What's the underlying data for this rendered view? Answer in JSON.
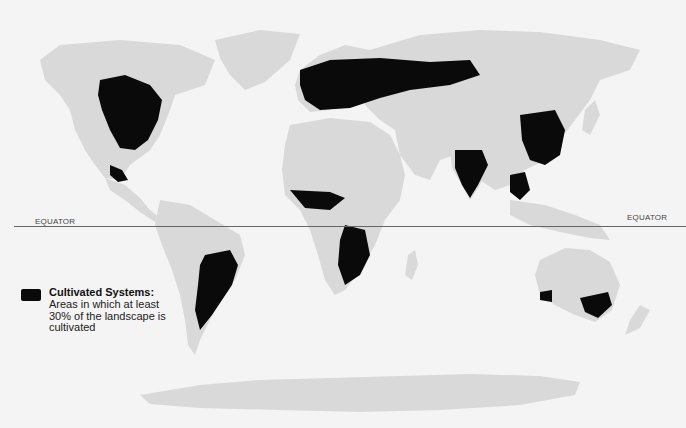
{
  "map": {
    "type": "world-thematic-map",
    "equator_label_left": "EQUATOR",
    "equator_label_right": "EQUATOR",
    "legend": {
      "swatch_color": "#0a0a0a",
      "title": "Cultivated Systems:",
      "description": "Areas in which at least 30% of the landscape is cultivated"
    },
    "colors": {
      "background": "#f4f4f4",
      "land": "#d9d9d9",
      "cultivated": "#0a0a0a",
      "equator_line": "#666666"
    }
  }
}
